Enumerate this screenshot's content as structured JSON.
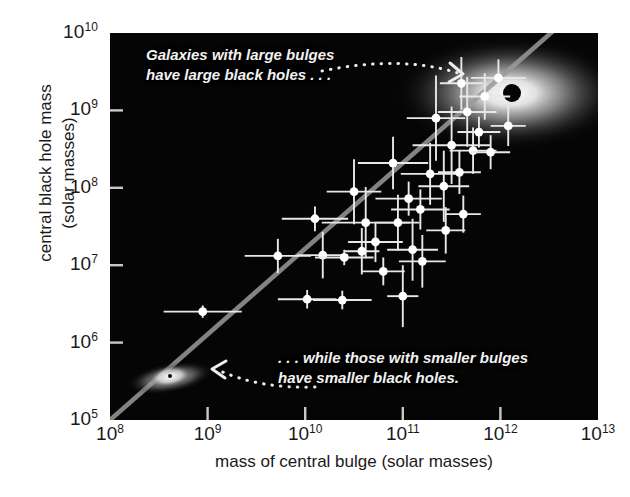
{
  "figure": {
    "kind": "scientific-scatter-plot",
    "background": "#ffffff",
    "panel_background": "#050505",
    "marker_color": "#ffffff",
    "trendline_color": "#9a9a9a",
    "annotation_color": "#f2f2f2"
  },
  "axes": {
    "x_title": "mass of central bulge (solar masses)",
    "y_title_line1": "central black hole mass",
    "y_title_line2": "(solar masses)",
    "x_ticks": [
      "10⁸",
      "10⁹",
      "10¹⁰",
      "10¹¹",
      "10¹²",
      "10¹³"
    ],
    "y_ticks": [
      "10¹⁰",
      "10⁹",
      "10⁸",
      "10⁷",
      "10⁶",
      "10⁵"
    ],
    "x_tick_mantissa": [
      "10",
      "10",
      "10",
      "10",
      "10",
      "10"
    ],
    "x_tick_exponent": [
      "8",
      "9",
      "10",
      "11",
      "12",
      "13"
    ],
    "y_tick_mantissa": [
      "10",
      "10",
      "10",
      "10",
      "10",
      "10"
    ],
    "y_tick_exponent": [
      "10",
      "9",
      "8",
      "7",
      "6",
      "5"
    ]
  },
  "annotations": {
    "top_line1": "Galaxies with large bulges",
    "top_line2": "have large black holes . . .",
    "bottom_line1": ". . . while those with smaller bulges",
    "bottom_line2": "have smaller black holes."
  },
  "chart_data": {
    "type": "scatter",
    "title": "",
    "xlabel": "mass of central bulge (solar masses)",
    "ylabel": "central black hole mass (solar masses)",
    "xscale": "log",
    "yscale": "log",
    "xlim": [
      100000000.0,
      10000000000000.0
    ],
    "ylim": [
      100000.0,
      10000000000.0
    ],
    "grid": false,
    "legend": "none",
    "xlabel_note": "log10 values given below are exponents of solar masses",
    "points": [
      {
        "logx": 8.95,
        "logy": 6.4,
        "xerr": 0.4,
        "yerr": 0.08
      },
      {
        "logx": 9.72,
        "logy": 7.12,
        "xerr": 0.34,
        "yerr": 0.22
      },
      {
        "logx": 10.18,
        "logy": 7.13,
        "xerr": 0.26,
        "yerr": 0.3
      },
      {
        "logx": 10.4,
        "logy": 7.1,
        "xerr": 0.3,
        "yerr": 0.1
      },
      {
        "logx": 10.02,
        "logy": 6.56,
        "xerr": 0.3,
        "yerr": 0.12
      },
      {
        "logx": 10.38,
        "logy": 6.55,
        "xerr": 0.3,
        "yerr": 0.12
      },
      {
        "logx": 11.0,
        "logy": 6.6,
        "xerr": 0.16,
        "yerr": 0.4
      },
      {
        "logx": 10.5,
        "logy": 7.95,
        "xerr": 0.28,
        "yerr": 0.42
      },
      {
        "logx": 10.1,
        "logy": 7.6,
        "xerr": 0.34,
        "yerr": 0.16
      },
      {
        "logx": 10.62,
        "logy": 7.55,
        "xerr": 0.45,
        "yerr": 0.46
      },
      {
        "logx": 10.95,
        "logy": 7.55,
        "xerr": 0.22,
        "yerr": 0.36
      },
      {
        "logx": 10.72,
        "logy": 7.3,
        "xerr": 0.28,
        "yerr": 0.26
      },
      {
        "logx": 10.58,
        "logy": 7.18,
        "xerr": 0.18,
        "yerr": 0.3
      },
      {
        "logx": 11.1,
        "logy": 7.2,
        "xerr": 0.26,
        "yerr": 0.4
      },
      {
        "logx": 11.18,
        "logy": 7.72,
        "xerr": 0.3,
        "yerr": 0.26
      },
      {
        "logx": 11.06,
        "logy": 7.86,
        "xerr": 0.34,
        "yerr": 0.22
      },
      {
        "logx": 11.28,
        "logy": 8.18,
        "xerr": 0.3,
        "yerr": 0.4
      },
      {
        "logx": 10.9,
        "logy": 8.32,
        "xerr": 0.36,
        "yerr": 0.34
      },
      {
        "logx": 11.42,
        "logy": 8.02,
        "xerr": 0.26,
        "yerr": 0.46
      },
      {
        "logx": 11.58,
        "logy": 8.2,
        "xerr": 0.22,
        "yerr": 0.28
      },
      {
        "logx": 11.5,
        "logy": 8.55,
        "xerr": 0.4,
        "yerr": 0.5
      },
      {
        "logx": 11.72,
        "logy": 8.48,
        "xerr": 0.24,
        "yerr": 0.3
      },
      {
        "logx": 11.9,
        "logy": 8.46,
        "xerr": 0.2,
        "yerr": 0.22
      },
      {
        "logx": 11.34,
        "logy": 8.9,
        "xerr": 0.3,
        "yerr": 0.55
      },
      {
        "logx": 11.66,
        "logy": 8.98,
        "xerr": 0.3,
        "yerr": 0.45
      },
      {
        "logx": 11.84,
        "logy": 9.18,
        "xerr": 0.26,
        "yerr": 0.3
      },
      {
        "logx": 11.6,
        "logy": 9.35,
        "xerr": 0.22,
        "yerr": 0.34
      },
      {
        "logx": 11.98,
        "logy": 9.42,
        "xerr": 0.28,
        "yerr": 0.24
      },
      {
        "logx": 12.08,
        "logy": 8.8,
        "xerr": 0.18,
        "yerr": 0.26
      },
      {
        "logx": 11.2,
        "logy": 7.05,
        "xerr": 0.24,
        "yerr": 0.34
      },
      {
        "logx": 11.44,
        "logy": 7.45,
        "xerr": 0.2,
        "yerr": 0.3
      },
      {
        "logx": 10.8,
        "logy": 6.92,
        "xerr": 0.22,
        "yerr": 0.18
      },
      {
        "logx": 11.62,
        "logy": 7.66,
        "xerr": 0.18,
        "yerr": 0.24
      },
      {
        "logx": 11.78,
        "logy": 8.72,
        "xerr": 0.22,
        "yerr": 0.2
      }
    ],
    "trendline": {
      "description": "best-fit power-law relation between bulge mass and black hole mass",
      "p1": {
        "logx": 8.0,
        "logy": 5.0
      },
      "p2": {
        "logx": 12.55,
        "logy": 10.0
      },
      "color": "#9a9a9a"
    },
    "inset_images": [
      {
        "name": "large-elliptical-galaxy",
        "logx": 12.05,
        "logy": 9.15,
        "note": "bright diffuse elliptical galaxy glow"
      },
      {
        "name": "black-hole-dot",
        "logx": 12.35,
        "logy": 9.2,
        "note": "black dot marking the central black hole"
      },
      {
        "name": "small-spiral-galaxy",
        "logx": 8.95,
        "logy": 5.5,
        "note": "small faint disk galaxy"
      }
    ]
  }
}
